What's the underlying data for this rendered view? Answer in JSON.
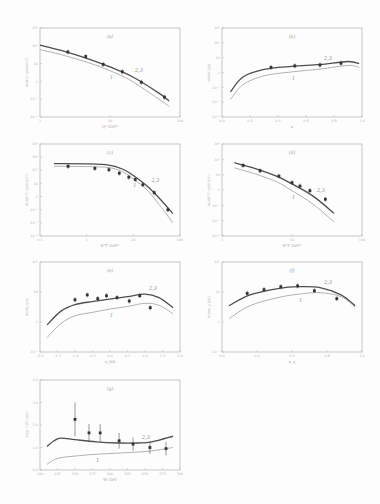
{
  "figure": {
    "curve_labels": {
      "upper": "2,3",
      "lower": "1"
    },
    "colors": {
      "frame": "#b8b8b8",
      "curve_upper": "#4e4e4e",
      "curve_lower": "#9e9e9e",
      "points": "#333333"
    }
  },
  "chart_data": [
    {
      "panel": "(a)",
      "type": "line",
      "yscale": "log",
      "xscale": "log",
      "xlabel": "Q² GeV²",
      "ylabel": "dσ/dQ² (pb/GeV²)",
      "xlim": [
        1,
        100
      ],
      "ylim": [
        0.01,
        1000
      ],
      "xticks": [
        "1",
        "10",
        "100"
      ],
      "yticks": [
        "10⁻²",
        "10⁻¹",
        "1",
        "10",
        "10²",
        "10³"
      ],
      "points": {
        "x": [
          2.5,
          4.5,
          8,
          15,
          28,
          60
        ],
        "y": [
          45,
          25,
          9,
          3.5,
          0.9,
          0.13
        ]
      },
      "series": [
        {
          "name": "2,3",
          "x": [
            1,
            2,
            5,
            10,
            20,
            50,
            70
          ],
          "y": [
            110,
            55,
            18,
            6.5,
            2.0,
            0.22,
            0.08
          ]
        },
        {
          "name": "1",
          "x": [
            1,
            2,
            5,
            10,
            20,
            50,
            70
          ],
          "y": [
            60,
            32,
            11,
            4,
            1.1,
            0.1,
            0.04
          ]
        }
      ]
    },
    {
      "panel": "(b)",
      "type": "line",
      "yscale": "log",
      "xlabel": "x",
      "ylabel": "dσ/dx (pb)",
      "xlim": [
        0.0,
        1.0
      ],
      "ylim": [
        0.001,
        1000
      ],
      "xticks": [
        "0.0",
        "0.2",
        "0.4",
        "0.6",
        "0.8",
        "1.0"
      ],
      "yticks": [
        "10⁻³",
        "10⁻²",
        "10⁻¹",
        "1",
        "10",
        "10²",
        "10³"
      ],
      "points": {
        "x": [
          0.35,
          0.52,
          0.7,
          0.85
        ],
        "y": [
          2.2,
          2.8,
          3.2,
          4.2
        ]
      },
      "series": [
        {
          "name": "2,3",
          "x": [
            0.06,
            0.15,
            0.3,
            0.5,
            0.7,
            0.9,
            0.98
          ],
          "y": [
            0.05,
            0.5,
            1.6,
            2.6,
            3.5,
            5.5,
            4.0
          ]
        },
        {
          "name": "1",
          "x": [
            0.06,
            0.15,
            0.3,
            0.5,
            0.7,
            0.9,
            0.98
          ],
          "y": [
            0.015,
            0.15,
            0.6,
            1.1,
            1.7,
            3.0,
            2.2
          ]
        }
      ]
    },
    {
      "panel": "(c)",
      "type": "line",
      "yscale": "log",
      "xscale": "log",
      "xlabel": "E²T GeV²",
      "ylabel": "dσ/dE²T (pb/GeV²)",
      "xlim": [
        0.1,
        100
      ],
      "ylim": [
        0.001,
        10000
      ],
      "xticks": [
        "0.1",
        "1",
        "10",
        "100"
      ],
      "yticks": [
        "10⁻³",
        "10⁻²",
        "10⁻¹",
        "1",
        "10",
        "10²",
        "10³",
        "10⁴"
      ],
      "points": {
        "x": [
          0.4,
          1.5,
          3,
          5,
          8,
          11,
          16,
          28,
          55
        ],
        "y": [
          200,
          140,
          110,
          60,
          30,
          20,
          8,
          2,
          0.1
        ]
      },
      "series": [
        {
          "name": "2,3",
          "x": [
            0.2,
            1,
            3,
            6,
            10,
            20,
            40,
            70
          ],
          "y": [
            320,
            310,
            250,
            120,
            40,
            6,
            0.5,
            0.05
          ]
        },
        {
          "name": "1",
          "x": [
            0.2,
            1,
            3,
            6,
            10,
            20,
            40,
            70
          ],
          "y": [
            200,
            190,
            160,
            75,
            22,
            3,
            0.15,
            0.01
          ]
        }
      ]
    },
    {
      "panel": "(d)",
      "type": "line",
      "yscale": "log",
      "xscale": "log",
      "xlabel": "E²T GeV²",
      "ylabel": "dσ/dE²T (pb/GeV²)",
      "xlim": [
        1,
        100
      ],
      "ylim": [
        0.001,
        1000
      ],
      "xticks": [
        "1",
        "10",
        "100"
      ],
      "yticks": [
        "10⁻³",
        "10⁻²",
        "10⁻¹",
        "1",
        "10",
        "10²",
        "10³"
      ],
      "points": {
        "x": [
          2,
          3.5,
          6.5,
          10,
          13,
          18,
          30
        ],
        "y": [
          40,
          18,
          8,
          3,
          1.8,
          0.9,
          0.25
        ]
      },
      "series": [
        {
          "name": "2,3",
          "x": [
            1.5,
            3,
            6,
            10,
            20,
            40
          ],
          "y": [
            60,
            25,
            8,
            2.5,
            0.4,
            0.03
          ]
        },
        {
          "name": "1",
          "x": [
            1.5,
            3,
            6,
            10,
            20,
            40
          ],
          "y": [
            28,
            11,
            3.5,
            0.9,
            0.12,
            0.008
          ]
        }
      ]
    },
    {
      "panel": "(e)",
      "type": "line",
      "yscale": "log",
      "xlabel": "η_lab",
      "ylabel": "dσ/dη (pb)",
      "xlim": [
        -2.0,
        2.0
      ],
      "ylim": [
        0.1,
        100
      ],
      "xticks": [
        "-2.0",
        "-1.5",
        "-1.0",
        "-0.5",
        "0.0",
        "0.5",
        "1.0",
        "1.5",
        "2.0"
      ],
      "yticks": [
        "10⁻¹",
        "1",
        "10",
        "10²"
      ],
      "points": {
        "x": [
          -1.0,
          -0.65,
          -0.35,
          -0.1,
          0.2,
          0.55,
          0.85,
          1.15
        ],
        "y": [
          5.5,
          8,
          6,
          7.5,
          6.5,
          5.0,
          7.5,
          3.0
        ]
      },
      "series": [
        {
          "name": "2,3",
          "x": [
            -1.8,
            -1.4,
            -1.0,
            -0.5,
            0.0,
            0.5,
            1.0,
            1.4,
            1.8
          ],
          "y": [
            0.8,
            2.3,
            3.8,
            4.8,
            5.8,
            7.0,
            8.5,
            6.5,
            3.0
          ]
        },
        {
          "name": "1",
          "x": [
            -1.8,
            -1.4,
            -1.0,
            -0.5,
            0.0,
            0.5,
            1.0,
            1.4,
            1.8
          ],
          "y": [
            0.3,
            0.9,
            1.6,
            2.1,
            2.7,
            3.3,
            4.2,
            3.6,
            1.9
          ]
        }
      ]
    },
    {
      "panel": "(f)",
      "type": "line",
      "yscale": "log",
      "xlabel": "x_γ",
      "ylabel": "dσ/dx_γ (pb)",
      "xlim": [
        0.0,
        1.0
      ],
      "ylim": [
        0.1,
        100
      ],
      "xticks": [
        "0.0",
        "0.2",
        "0.5",
        "0.8",
        "1.0"
      ],
      "yticks": [
        "10⁻¹",
        "1",
        "10",
        "10²"
      ],
      "points": {
        "x": [
          0.18,
          0.3,
          0.42,
          0.54,
          0.66,
          0.82
        ],
        "y": [
          9,
          12,
          15,
          16,
          11,
          6
        ]
      },
      "series": [
        {
          "name": "2,3",
          "x": [
            0.05,
            0.2,
            0.4,
            0.55,
            0.7,
            0.85,
            0.95
          ],
          "y": [
            3.5,
            8,
            13,
            15,
            14,
            8,
            3.5
          ]
        },
        {
          "name": "1",
          "x": [
            0.05,
            0.2,
            0.4,
            0.55,
            0.7,
            0.85,
            0.95
          ],
          "y": [
            1.3,
            3.5,
            6.5,
            8.5,
            9.5,
            7,
            3.2
          ]
        }
      ]
    },
    {
      "panel": "(g)",
      "type": "line",
      "yscale": "linear",
      "xlabel": "W GeV",
      "ylabel": "σ(γp → jX) (nb)",
      "xlim": [
        100,
        300
      ],
      "ylim": [
        0.0,
        4.0
      ],
      "xticks": [
        "100",
        "125",
        "150",
        "175",
        "200",
        "225",
        "250",
        "275",
        "300"
      ],
      "yticks": [
        "0.0",
        "1.0",
        "2.0",
        "3.0",
        "4.0"
      ],
      "points": {
        "x": [
          150,
          170,
          186,
          213,
          233,
          257,
          280
        ],
        "y": [
          2.25,
          1.65,
          1.65,
          1.3,
          1.15,
          1.0,
          0.95
        ],
        "err": [
          0.75,
          0.4,
          0.4,
          0.35,
          0.3,
          0.28,
          0.3
        ]
      },
      "series": [
        {
          "name": "2,3",
          "x": [
            110,
            120,
            130,
            150,
            180,
            210,
            240,
            260,
            290
          ],
          "y": [
            1.05,
            1.3,
            1.42,
            1.35,
            1.25,
            1.2,
            1.2,
            1.25,
            1.5
          ]
        },
        {
          "name": "1",
          "x": [
            110,
            120,
            130,
            150,
            180,
            210,
            240,
            260,
            290
          ],
          "y": [
            0.25,
            0.45,
            0.55,
            0.62,
            0.7,
            0.75,
            0.8,
            0.85,
            1.0
          ]
        }
      ]
    }
  ],
  "panels_layout": [
    {
      "id": "a",
      "label": "(a)",
      "x": 40,
      "y": 28,
      "w": 140,
      "h": 89
    },
    {
      "id": "b",
      "label": "(b)",
      "x": 222,
      "y": 28,
      "w": 140,
      "h": 89
    },
    {
      "id": "c",
      "label": "(c)",
      "x": 40,
      "y": 144,
      "w": 140,
      "h": 92
    },
    {
      "id": "d",
      "label": "(d)",
      "x": 222,
      "y": 144,
      "w": 140,
      "h": 92
    },
    {
      "id": "e",
      "label": "(e)",
      "x": 40,
      "y": 262,
      "w": 140,
      "h": 90
    },
    {
      "id": "f",
      "label": "(f)",
      "x": 222,
      "y": 262,
      "w": 140,
      "h": 90
    },
    {
      "id": "g",
      "label": "(g)",
      "x": 40,
      "y": 380,
      "w": 140,
      "h": 90
    }
  ]
}
